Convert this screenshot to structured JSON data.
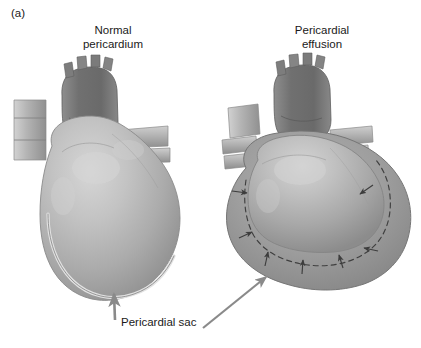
{
  "figure": {
    "panel_letter": "(a)",
    "titles": {
      "left": "Normal\npericardium",
      "right": "Pericardial\neffusion"
    },
    "caption": "Pericardial sac",
    "colors": {
      "background": "#ffffff",
      "text": "#1a1a1a",
      "heart_light": "#c6c6c6",
      "heart_mid": "#ababab",
      "heart_shadow": "#8e8e8e",
      "vessel_dark": "#7a7a7a",
      "effusion_fluid": "#9c9c9c",
      "pericardium_line": "#6e6e6e",
      "dashed_line": "#4a4a4a",
      "arrow": "#888888",
      "compression_arrow": "#3d3d3d"
    },
    "annotations": {
      "left_pointer": {
        "name": "pericardial-sac-arrow-left",
        "from_x": 115,
        "from_y": 320,
        "to_x": 114,
        "to_y": 293
      },
      "right_pointer": {
        "name": "pericardial-sac-arrow-right",
        "from_x": 203,
        "from_y": 328,
        "to_x": 266,
        "to_y": 276
      }
    },
    "compression_arrows": [
      {
        "x1": 232,
        "y1": 191,
        "x2": 247,
        "y2": 193
      },
      {
        "x1": 239,
        "y1": 238,
        "x2": 252,
        "y2": 232
      },
      {
        "x1": 265,
        "y1": 266,
        "x2": 268,
        "y2": 252
      },
      {
        "x1": 302,
        "y1": 273,
        "x2": 303,
        "y2": 259
      },
      {
        "x1": 343,
        "y1": 267,
        "x2": 339,
        "y2": 254
      },
      {
        "x1": 377,
        "y1": 250,
        "x2": 363,
        "y2": 247
      },
      {
        "x1": 372,
        "y1": 185,
        "x2": 359,
        "y2": 194
      }
    ]
  }
}
